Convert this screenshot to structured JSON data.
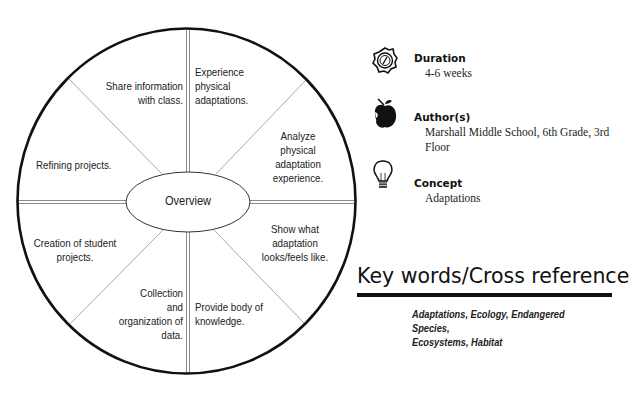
{
  "diagram": {
    "center_label": "Overview",
    "segments": [
      {
        "position": "top-left",
        "text_lines": [
          "Share information",
          "with class."
        ]
      },
      {
        "position": "top-right",
        "text_lines": [
          "Experience",
          "physical",
          "adaptations."
        ]
      },
      {
        "position": "right-upper",
        "text_lines": [
          "Analyze",
          "physical",
          "adaptation",
          "experience."
        ]
      },
      {
        "position": "right-lower",
        "text_lines": [
          "Show what",
          "adaptation",
          "looks/feels like."
        ]
      },
      {
        "position": "bottom-right",
        "text_lines": [
          "Provide body of",
          "knowledge."
        ]
      },
      {
        "position": "bottom-left",
        "text_lines": [
          "Collection",
          "and",
          "organization of",
          "data."
        ]
      },
      {
        "position": "left-lower",
        "text_lines": [
          "Creation of student",
          "projects."
        ]
      },
      {
        "position": "left-upper",
        "text_lines": [
          "Refining projects."
        ]
      }
    ],
    "colors": {
      "outline": "#111111",
      "spokes": "#9a9a9a"
    }
  },
  "info": {
    "duration": {
      "icon": "compass-icon",
      "label": "Duration",
      "value": "4-6 weeks"
    },
    "authors": {
      "icon": "apple-icon",
      "label": "Author(s)",
      "value_lines": [
        "Marshall Middle School, 6th Grade, 3rd",
        "Floor"
      ]
    },
    "concept": {
      "icon": "lightbulb-icon",
      "label": "Concept",
      "value": "Adaptations"
    }
  },
  "keywords": {
    "title": "Key words/Cross reference",
    "text_lines": [
      "Adaptations, Ecology, Endangered Species,",
      "Ecosystems, Habitat"
    ]
  }
}
